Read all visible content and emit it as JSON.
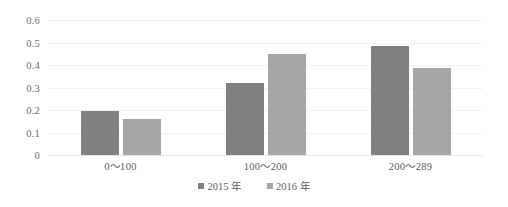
{
  "chart_data": {
    "type": "bar",
    "title": "",
    "subtitle": "",
    "xlabel": "",
    "ylabel": "",
    "categories": [
      "0～100",
      "100～200",
      "200～289"
    ],
    "series": [
      {
        "name": "2015 年",
        "values": [
          0.195,
          0.32,
          0.485
        ],
        "color": "#808080"
      },
      {
        "name": "2016 年",
        "values": [
          0.16,
          0.45,
          0.385
        ],
        "color": "#a6a6a6"
      }
    ],
    "ylim": [
      0,
      0.6
    ],
    "ytick_labels": [
      "0",
      "0.1",
      "0.2",
      "0.3",
      "0.4",
      "0.5",
      "0.6"
    ],
    "ytick_values": [
      0,
      0.1,
      0.2,
      0.3,
      0.4,
      0.5,
      0.6
    ],
    "grid": true,
    "grid_axis": "y",
    "legend_position": "bottom",
    "data_labels_shown": false,
    "background_color": "#ffffff",
    "gridline_color": "#f2f2f2"
  }
}
